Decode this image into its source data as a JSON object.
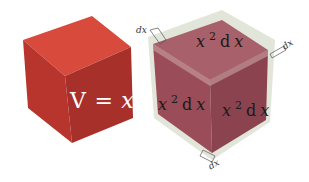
{
  "diagram": {
    "left_cube": {
      "label_lhs": "V",
      "label_eq": "=",
      "label_var": "x",
      "label_exp": "3",
      "colors": {
        "top": "#d84a3c",
        "left": "#c0392f",
        "right": "#a83228"
      }
    },
    "right_cube": {
      "face_labels": [
        {
          "face": "top",
          "coef": "x",
          "exp": "2",
          "d": "d",
          "var": "x"
        },
        {
          "face": "left",
          "coef": "x",
          "exp": "2",
          "d": "d",
          "var": "x"
        },
        {
          "face": "right",
          "coef": "x",
          "exp": "2",
          "d": "d",
          "var": "x"
        }
      ],
      "thickness_labels": [
        "dx",
        "dx",
        "dx"
      ],
      "colors": {
        "top": "#a8606a",
        "left": "#9c4f5a",
        "right": "#8e4450",
        "shell": "#d8dccf"
      }
    }
  }
}
